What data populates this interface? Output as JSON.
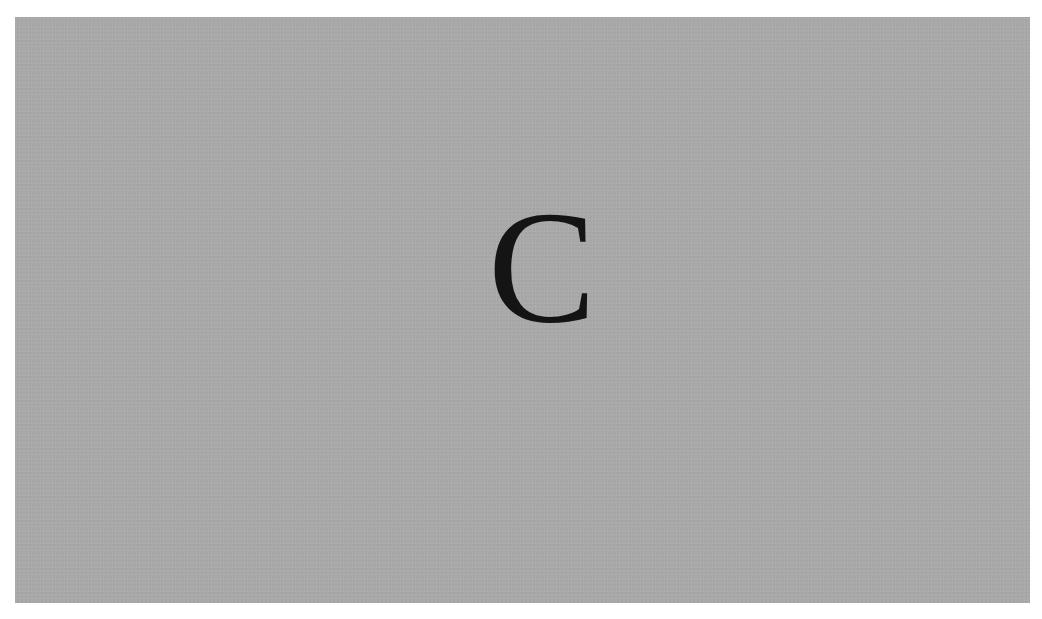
{
  "card": {
    "letter": "C",
    "background_color": "#a9a9a9",
    "letter_color": "#141414"
  }
}
